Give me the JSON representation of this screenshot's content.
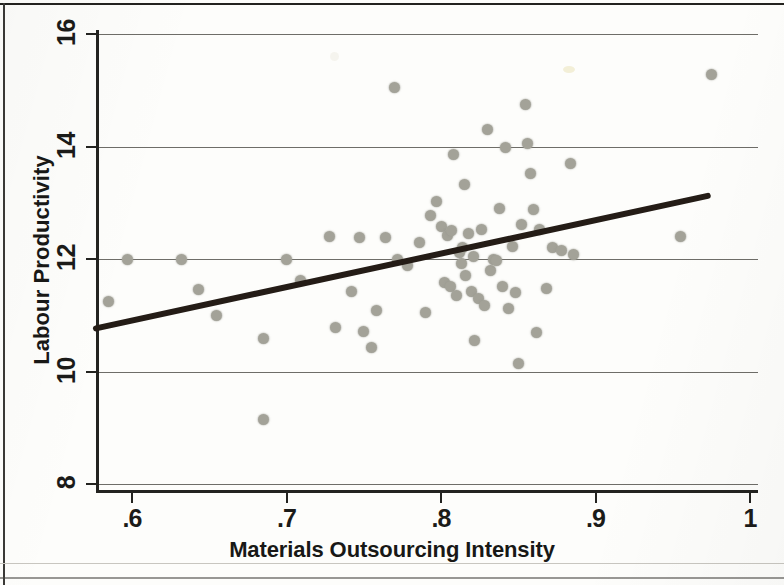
{
  "figure": {
    "y_axis_title": "Labour Productivity",
    "x_axis_title": "Materials Outsourcing Intensity"
  },
  "chart_data": {
    "type": "scatter",
    "title": "",
    "xlabel": "Materials Outsourcing Intensity",
    "ylabel": "Labour Productivity",
    "xlim": [
      0.5725,
      1.0
    ],
    "ylim": [
      8,
      16
    ],
    "xticks": [
      0.6,
      0.7,
      0.8,
      0.9,
      1.0
    ],
    "xtick_labels": [
      ".6",
      ".7",
      ".8",
      ".9",
      "1"
    ],
    "yticks": [
      8,
      10,
      12,
      14,
      16
    ],
    "ytick_labels": [
      "8",
      "10",
      "12",
      "14",
      "16"
    ],
    "grid": "horizontal",
    "legend": "none",
    "marker_color": "#a3a298",
    "fit_line_color": "#241c16",
    "series": [
      {
        "name": "Firms",
        "points": [
          [
            0.585,
            11.25
          ],
          [
            0.597,
            12.0
          ],
          [
            0.632,
            12.0
          ],
          [
            0.643,
            11.45
          ],
          [
            0.655,
            11.0
          ],
          [
            0.685,
            10.58
          ],
          [
            0.685,
            9.15
          ],
          [
            0.7,
            12.0
          ],
          [
            0.709,
            11.62
          ],
          [
            0.728,
            12.4
          ],
          [
            0.732,
            10.78
          ],
          [
            0.742,
            11.42
          ],
          [
            0.747,
            12.38
          ],
          [
            0.75,
            10.72
          ],
          [
            0.755,
            10.42
          ],
          [
            0.758,
            11.08
          ],
          [
            0.764,
            12.38
          ],
          [
            0.77,
            15.05
          ],
          [
            0.772,
            12.0
          ],
          [
            0.778,
            11.88
          ],
          [
            0.786,
            12.3
          ],
          [
            0.79,
            11.05
          ],
          [
            0.793,
            12.78
          ],
          [
            0.797,
            13.02
          ],
          [
            0.8,
            12.58
          ],
          [
            0.802,
            11.58
          ],
          [
            0.804,
            12.42
          ],
          [
            0.806,
            11.52
          ],
          [
            0.807,
            12.5
          ],
          [
            0.808,
            13.85
          ],
          [
            0.81,
            11.35
          ],
          [
            0.812,
            12.12
          ],
          [
            0.813,
            11.92
          ],
          [
            0.814,
            12.2
          ],
          [
            0.815,
            13.32
          ],
          [
            0.816,
            11.7
          ],
          [
            0.818,
            12.45
          ],
          [
            0.82,
            11.42
          ],
          [
            0.821,
            12.05
          ],
          [
            0.822,
            10.55
          ],
          [
            0.824,
            11.3
          ],
          [
            0.826,
            12.52
          ],
          [
            0.828,
            11.18
          ],
          [
            0.83,
            14.3
          ],
          [
            0.832,
            11.8
          ],
          [
            0.834,
            12.0
          ],
          [
            0.836,
            11.98
          ],
          [
            0.838,
            12.9
          ],
          [
            0.84,
            11.52
          ],
          [
            0.842,
            13.98
          ],
          [
            0.844,
            11.12
          ],
          [
            0.846,
            12.22
          ],
          [
            0.848,
            11.4
          ],
          [
            0.85,
            10.15
          ],
          [
            0.852,
            12.62
          ],
          [
            0.855,
            14.75
          ],
          [
            0.856,
            14.05
          ],
          [
            0.858,
            13.52
          ],
          [
            0.86,
            12.88
          ],
          [
            0.862,
            10.7
          ],
          [
            0.864,
            12.52
          ],
          [
            0.868,
            11.48
          ],
          [
            0.872,
            12.2
          ],
          [
            0.878,
            12.15
          ],
          [
            0.884,
            13.7
          ],
          [
            0.886,
            12.08
          ],
          [
            0.955,
            12.4
          ],
          [
            0.975,
            15.28
          ]
        ]
      }
    ],
    "fit_line": {
      "name": "Linear fit",
      "x": [
        0.5745,
        0.9745
      ],
      "y": [
        10.76,
        13.14
      ]
    }
  }
}
